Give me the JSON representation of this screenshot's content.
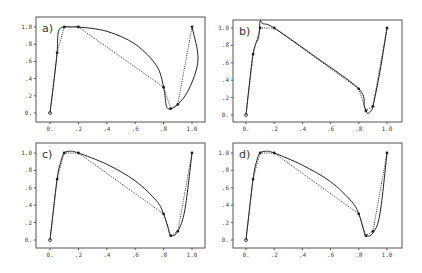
{
  "figure": {
    "panel_count": 4
  },
  "chart_data": [
    {
      "type": "line",
      "panel_label": "a)",
      "title": "",
      "xlabel": "",
      "ylabel": "",
      "xlim": [
        0,
        1.0
      ],
      "ylim": [
        0,
        1.0
      ],
      "x_tick_labels": [
        "0.",
        ".2",
        ".4",
        ".6",
        ".8",
        "1.0"
      ],
      "y_tick_labels": [
        "0.",
        ".2",
        ".4",
        ".6",
        ".8",
        "1.0"
      ],
      "grid": false,
      "series": [
        {
          "name": "control polygon",
          "style": "dotted",
          "x": [
            0.0,
            0.05,
            0.1,
            0.2,
            0.8,
            0.85,
            0.9,
            1.0
          ],
          "y": [
            0.0,
            0.7,
            1.0,
            1.0,
            0.3,
            0.05,
            0.1,
            1.0
          ]
        },
        {
          "name": "interpolating curve",
          "style": "solid",
          "x": [
            0.0,
            0.03,
            0.05,
            0.06,
            0.1,
            0.15,
            0.2,
            0.4,
            0.6,
            0.75,
            0.8,
            0.82,
            0.85,
            0.9,
            0.97,
            1.03,
            1.04,
            1.0
          ],
          "y": [
            0.0,
            0.4,
            0.7,
            0.95,
            1.0,
            1.0,
            1.0,
            0.95,
            0.8,
            0.55,
            0.3,
            0.08,
            0.05,
            0.1,
            0.25,
            0.5,
            0.7,
            1.0
          ]
        }
      ]
    },
    {
      "type": "line",
      "panel_label": "b)",
      "title": "",
      "xlabel": "",
      "ylabel": "",
      "xlim": [
        0,
        1.0
      ],
      "ylim": [
        0,
        1.0
      ],
      "x_tick_labels": [
        "0.",
        ".2",
        ".4",
        ".6",
        ".8",
        "1.0"
      ],
      "y_tick_labels": [
        "0.",
        ".2",
        ".4",
        ".6",
        ".8",
        "1.0"
      ],
      "grid": false,
      "series": [
        {
          "name": "control polygon",
          "style": "dotted",
          "x": [
            0.0,
            0.05,
            0.1,
            0.2,
            0.8,
            0.85,
            0.9,
            1.0
          ],
          "y": [
            0.0,
            0.7,
            1.0,
            1.0,
            0.3,
            0.05,
            0.1,
            1.0
          ]
        },
        {
          "name": "interpolating curve",
          "style": "solid",
          "x": [
            0.0,
            0.05,
            0.09,
            0.1,
            0.12,
            0.2,
            0.5,
            0.8,
            0.84,
            0.86,
            0.88,
            0.9,
            0.95,
            1.0
          ],
          "y": [
            0.0,
            0.7,
            0.9,
            1.08,
            1.05,
            1.0,
            0.66,
            0.3,
            0.1,
            0.02,
            0.04,
            0.1,
            0.5,
            1.0
          ]
        }
      ]
    },
    {
      "type": "line",
      "panel_label": "c)",
      "title": "",
      "xlabel": "",
      "ylabel": "",
      "xlim": [
        0,
        1.0
      ],
      "ylim": [
        0,
        1.0
      ],
      "x_tick_labels": [
        "0.",
        ".2",
        ".4",
        ".6",
        ".8",
        "1.0"
      ],
      "y_tick_labels": [
        "0.",
        ".2",
        ".4",
        ".6",
        ".8",
        "1.0"
      ],
      "grid": false,
      "series": [
        {
          "name": "control polygon",
          "style": "dotted",
          "x": [
            0.0,
            0.05,
            0.1,
            0.2,
            0.8,
            0.85,
            0.9,
            1.0
          ],
          "y": [
            0.0,
            0.7,
            1.0,
            1.0,
            0.3,
            0.05,
            0.1,
            1.0
          ]
        },
        {
          "name": "interpolating curve",
          "style": "solid",
          "x": [
            0.0,
            0.05,
            0.08,
            0.1,
            0.14,
            0.2,
            0.4,
            0.6,
            0.75,
            0.8,
            0.83,
            0.85,
            0.9,
            0.95,
            1.0
          ],
          "y": [
            0.0,
            0.7,
            0.92,
            1.0,
            1.02,
            1.0,
            0.87,
            0.68,
            0.45,
            0.3,
            0.15,
            0.05,
            0.1,
            0.35,
            1.0
          ]
        }
      ]
    },
    {
      "type": "line",
      "panel_label": "d)",
      "title": "",
      "xlabel": "",
      "ylabel": "",
      "xlim": [
        0,
        1.0
      ],
      "ylim": [
        0,
        1.0
      ],
      "x_tick_labels": [
        "0.",
        ".2",
        ".4",
        ".6",
        ".8",
        "1.0"
      ],
      "y_tick_labels": [
        "0.",
        ".2",
        ".4",
        ".6",
        ".8",
        "1.0"
      ],
      "grid": false,
      "series": [
        {
          "name": "control polygon",
          "style": "dotted",
          "x": [
            0.0,
            0.05,
            0.1,
            0.2,
            0.8,
            0.85,
            0.9,
            1.0
          ],
          "y": [
            0.0,
            0.7,
            1.0,
            1.0,
            0.3,
            0.05,
            0.1,
            1.0
          ]
        },
        {
          "name": "interpolating curve",
          "style": "solid",
          "x": [
            0.0,
            0.05,
            0.08,
            0.1,
            0.14,
            0.2,
            0.4,
            0.6,
            0.75,
            0.8,
            0.83,
            0.85,
            0.9,
            0.95,
            1.0
          ],
          "y": [
            0.0,
            0.7,
            0.93,
            1.0,
            1.02,
            1.0,
            0.86,
            0.67,
            0.44,
            0.3,
            0.14,
            0.05,
            0.08,
            0.3,
            1.0
          ]
        }
      ]
    }
  ],
  "layout": {
    "panels": [
      {
        "frame": [
          36,
          17,
          205,
          122
        ],
        "x0": 50,
        "x1": 192,
        "y0": 113,
        "y1": 27
      },
      {
        "frame": [
          233,
          20,
          402,
          122
        ],
        "x0": 246,
        "x1": 387,
        "y0": 115,
        "y1": 28
      },
      {
        "frame": [
          36,
          143,
          205,
          248
        ],
        "x0": 50,
        "x1": 192,
        "y0": 240,
        "y1": 153
      },
      {
        "frame": [
          233,
          143,
          402,
          248
        ],
        "x0": 246,
        "x1": 387,
        "y0": 240,
        "y1": 153
      }
    ]
  }
}
